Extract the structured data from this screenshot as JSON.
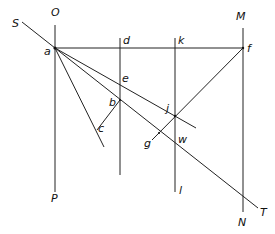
{
  "figure": {
    "type": "geometric-construction",
    "labels": {
      "O": "O",
      "P": "P",
      "S": "S",
      "T": "T",
      "M": "M",
      "N": "N",
      "a": "a",
      "b": "b",
      "c": "c",
      "d": "d",
      "e": "e",
      "f": "f",
      "g": "g",
      "j": "j",
      "k": "k",
      "l": "l",
      "w": "w"
    },
    "points": {
      "a": [
        55,
        48
      ],
      "b": [
        120,
        100
      ],
      "c": [
        97,
        130
      ],
      "d": [
        120,
        48
      ],
      "e": [
        120,
        84
      ],
      "f": [
        243,
        48
      ],
      "g": [
        159,
        133
      ],
      "j": [
        175,
        116
      ],
      "k": [
        175,
        48
      ],
      "w": [
        175,
        142
      ]
    },
    "lines": [
      {
        "name": "O-P",
        "from": [
          55,
          25
        ],
        "to": [
          55,
          192
        ]
      },
      {
        "name": "d-vertical",
        "from": [
          120,
          38
        ],
        "to": [
          120,
          175
        ]
      },
      {
        "name": "k-l",
        "from": [
          175,
          38
        ],
        "to": [
          175,
          192
        ]
      },
      {
        "name": "M-N",
        "from": [
          243,
          28
        ],
        "to": [
          243,
          212
        ]
      },
      {
        "name": "a-f",
        "from": [
          55,
          48
        ],
        "to": [
          243,
          48
        ]
      },
      {
        "name": "S-T",
        "from": [
          22,
          22
        ],
        "to": [
          258,
          208
        ]
      },
      {
        "name": "a-e-j",
        "from": [
          55,
          48
        ],
        "to": [
          196,
          128
        ]
      },
      {
        "name": "a-c",
        "from": [
          55,
          48
        ],
        "to": [
          104,
          147
        ]
      },
      {
        "name": "b-c",
        "from": [
          120,
          100
        ],
        "to": [
          97,
          130
        ]
      },
      {
        "name": "f-g",
        "from": [
          243,
          48
        ],
        "to": [
          152,
          140
        ]
      }
    ]
  }
}
